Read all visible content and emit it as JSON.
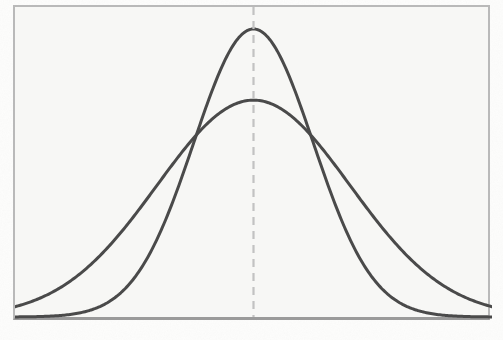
{
  "figure": {
    "kind": "scanned-book-figure",
    "background_color": "#f7f7f5",
    "page_color": "#fdfdfc",
    "frame_border_color": "#b9b9b9",
    "baseline_color": "#9a9a9a",
    "caption": ""
  },
  "ghost_text": {
    "note": "faint bleed-through from reverse side of the printed page; illegible",
    "lines": [
      {
        "text": "                                 ",
        "x": 55,
        "y": 86
      },
      {
        "text": "                                    ",
        "x": 30,
        "y": 108
      },
      {
        "text": "                                 ",
        "x": 66,
        "y": 130
      },
      {
        "text": "                              ",
        "x": 88,
        "y": 152
      },
      {
        "text": "                               ",
        "x": 74,
        "y": 196
      },
      {
        "text": "                            ",
        "x": 110,
        "y": 240
      },
      {
        "text": "                          ",
        "x": 120,
        "y": 262
      }
    ]
  },
  "chart_data": {
    "type": "line",
    "title": "",
    "subtitle": "",
    "xlabel": "",
    "ylabel": "",
    "grid": false,
    "legend": "none",
    "axis_visible": {
      "left": true,
      "right": true,
      "top": true,
      "bottom": true
    },
    "tick_labels": {
      "x": [],
      "y": []
    },
    "xlim": [
      -4,
      4
    ],
    "ylim": [
      0,
      1
    ],
    "mean": 0,
    "annotations": [
      {
        "name": "mean-dashed-line",
        "kind": "vertical-dashed-line",
        "x": 0,
        "color": "#c2c2c2",
        "dash": "8,6",
        "width": 2.2
      }
    ],
    "series": [
      {
        "name": "narrow-normal-curve",
        "label": "",
        "distribution": "normal",
        "mean": 0,
        "sigma": 1.0,
        "peak_height": 1.0,
        "color": "#4a4a4a",
        "line_width": 3.0,
        "x": [
          -4.0,
          -3.6,
          -3.2,
          -2.8,
          -2.4,
          -2.0,
          -1.6,
          -1.2,
          -0.8,
          -0.4,
          0.0,
          0.4,
          0.8,
          1.2,
          1.6,
          2.0,
          2.4,
          2.8,
          3.2,
          3.6,
          4.0
        ],
        "y": [
          0.0,
          0.002,
          0.006,
          0.02,
          0.056,
          0.135,
          0.278,
          0.487,
          0.726,
          0.923,
          1.0,
          0.923,
          0.726,
          0.487,
          0.278,
          0.135,
          0.056,
          0.02,
          0.006,
          0.002,
          0.0
        ]
      },
      {
        "name": "wide-normal-curve",
        "label": "",
        "distribution": "normal",
        "mean": 0,
        "sigma": 1.62,
        "peak_height": 0.753,
        "color": "#4a4a4a",
        "line_width": 3.0,
        "x": [
          -4.0,
          -3.6,
          -3.2,
          -2.8,
          -2.4,
          -2.0,
          -1.6,
          -1.2,
          -0.8,
          -0.4,
          0.0,
          0.4,
          0.8,
          1.2,
          1.6,
          2.0,
          2.4,
          2.8,
          3.2,
          3.6,
          4.0
        ],
        "y": [
          0.035,
          0.063,
          0.106,
          0.167,
          0.248,
          0.345,
          0.452,
          0.559,
          0.653,
          0.722,
          0.753,
          0.722,
          0.653,
          0.559,
          0.452,
          0.345,
          0.248,
          0.167,
          0.106,
          0.063,
          0.035
        ]
      }
    ],
    "intersections": [
      {
        "x": -0.99,
        "y": 0.615
      },
      {
        "x": 0.99,
        "y": 0.615
      }
    ]
  }
}
